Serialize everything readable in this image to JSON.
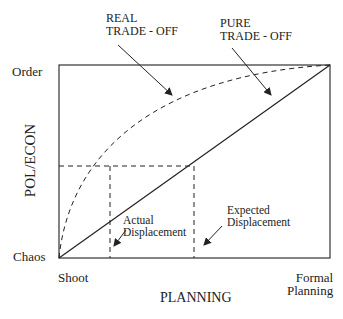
{
  "diagram": {
    "y_axis": {
      "title": "POL/ECON",
      "top_label": "Order",
      "bottom_label": "Chaos"
    },
    "x_axis": {
      "title": "PLANNING",
      "left_label": "Shoot",
      "right_label_line1": "Formal",
      "right_label_line2": "Planning"
    },
    "curves": {
      "real": {
        "line1": "REAL",
        "line2": "TRADE - OFF",
        "style": "dashed"
      },
      "pure": {
        "line1": "PURE",
        "line2": "TRADE - OFF",
        "style": "solid"
      }
    },
    "annotations": {
      "actual": {
        "line1": "Actual",
        "line2": "Displacement"
      },
      "expected": {
        "line1": "Expected",
        "line2": "Displacement"
      }
    },
    "colors": {
      "ink": "#222222",
      "background": "#ffffff"
    }
  }
}
